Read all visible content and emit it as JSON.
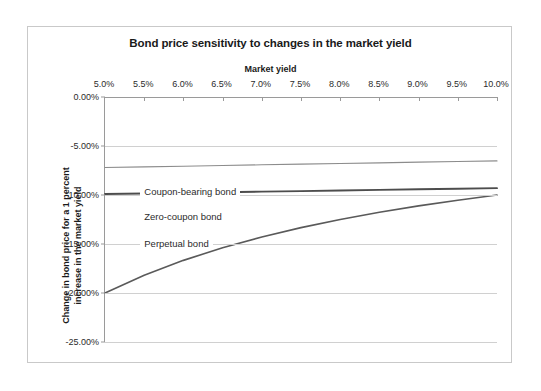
{
  "chart_data": {
    "type": "line",
    "title": "Bond price sensitivity to changes in the market yield",
    "xlabel": "Market yield",
    "ylabel": "Change in bond price for a 1 percent increase in the market yield",
    "ylabel_line1": "Change in bond price for a 1 percent",
    "ylabel_line2": "increase in the market yield",
    "x_axis_position": "top",
    "grid": true,
    "legend_position": "inline-labels",
    "xlim": [
      5.0,
      10.0
    ],
    "ylim": [
      -25.0,
      0.0
    ],
    "x_ticks": [
      "5.0%",
      "5.5%",
      "6.0%",
      "6.5%",
      "7.0%",
      "7.5%",
      "8.0%",
      "8.5%",
      "9.0%",
      "9.5%",
      "10.0%"
    ],
    "x_values": [
      5.0,
      5.5,
      6.0,
      6.5,
      7.0,
      7.5,
      8.0,
      8.5,
      9.0,
      9.5,
      10.0
    ],
    "y_ticks": [
      "0.00%",
      "-5.00%",
      "-10.00%",
      "-15.00%",
      "-20.00%",
      "-25.00%"
    ],
    "y_tick_values": [
      0.0,
      -5.0,
      -10.0,
      -15.0,
      -20.0,
      -25.0
    ],
    "series": [
      {
        "name": "Coupon-bearing bond",
        "color": "#8c8c8c",
        "width": 1.1,
        "label_x": 5.45,
        "label_y": -9.6,
        "values": [
          -7.2,
          -7.13,
          -7.06,
          -6.99,
          -6.92,
          -6.85,
          -6.78,
          -6.72,
          -6.65,
          -6.58,
          -6.52
        ]
      },
      {
        "name": "Zero-coupon bond",
        "color": "#4d4d4d",
        "width": 1.9,
        "label_x": 5.45,
        "label_y": -12.1,
        "values": [
          -9.9,
          -9.84,
          -9.78,
          -9.72,
          -9.66,
          -9.6,
          -9.54,
          -9.48,
          -9.42,
          -9.36,
          -9.3
        ]
      },
      {
        "name": "Perpetual bond",
        "color": "#5a5a5a",
        "width": 1.6,
        "label_x": 5.45,
        "label_y": -14.85,
        "values": [
          -20.0,
          -18.18,
          -16.67,
          -15.38,
          -14.29,
          -13.33,
          -12.5,
          -11.76,
          -11.11,
          -10.53,
          -10.0
        ]
      }
    ]
  }
}
